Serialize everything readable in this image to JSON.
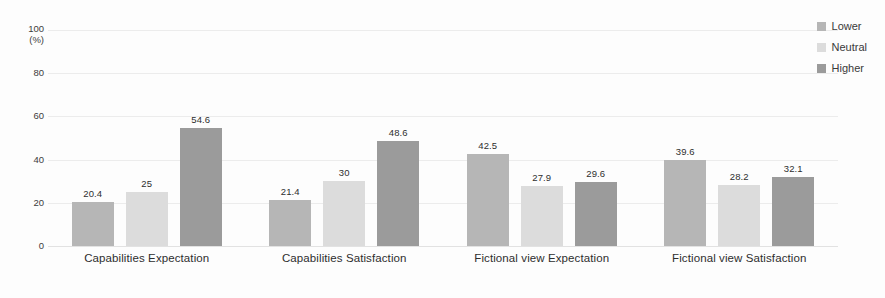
{
  "chart_data": {
    "type": "bar",
    "title": "",
    "subtitle": "",
    "xlabel": "",
    "ylabel": "",
    "yunit": "(%)",
    "ylim": [
      0,
      100
    ],
    "yticks": [
      0,
      20,
      40,
      60,
      80,
      100
    ],
    "ytick_labels": [
      "0",
      "20",
      "40",
      "60",
      "80",
      "100"
    ],
    "grid": true,
    "legend_position": "top-right",
    "categories": [
      "Capabilities Expectation",
      "Capabilities Satisfaction",
      "Fictional view Expectation",
      "Fictional view Satisfaction"
    ],
    "series": [
      {
        "name": "Lower",
        "color": "#b6b6b6",
        "values": [
          20.4,
          21.4,
          42.5,
          39.6
        ],
        "labels": [
          "20.4",
          "21.4",
          "42.5",
          "39.6"
        ]
      },
      {
        "name": "Neutral",
        "color": "#dcdcdc",
        "values": [
          25,
          30,
          27.9,
          28.2
        ],
        "labels": [
          "25",
          "30",
          "27.9",
          "28.2"
        ]
      },
      {
        "name": "Higher",
        "color": "#9b9b9b",
        "values": [
          54.6,
          48.6,
          29.6,
          32.1
        ],
        "labels": [
          "54.6",
          "48.6",
          "29.6",
          "32.1"
        ]
      }
    ]
  }
}
